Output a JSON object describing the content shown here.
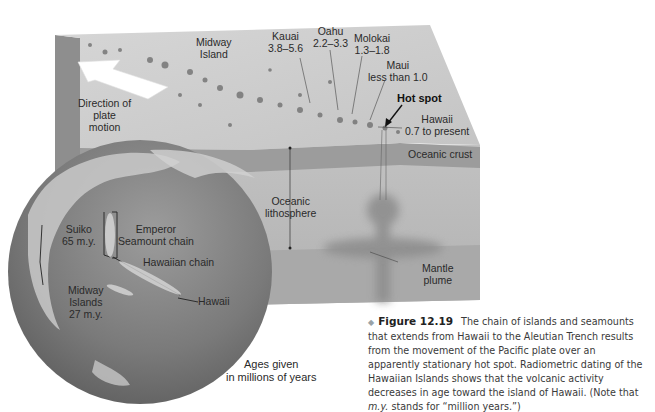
{
  "figure": {
    "number": "Figure 12.19",
    "bullet": "◆",
    "caption_parts": {
      "before_italic": "The chain of islands and seamounts that extends from Hawaii to the Aleutian Trench results from the movement of the Pacific plate over an apparently stationary hot spot. Radiometric dating of the Hawaiian Islands shows that the volcanic activity decreases in age toward the island of Hawaii. (Note that ",
      "italic": "m.y.",
      "after_italic": " stands for “million years.”)"
    }
  },
  "block_labels": {
    "midway": [
      "Midway",
      "Island"
    ],
    "kauai": [
      "Kauai",
      "3.8–5.6"
    ],
    "oahu": [
      "Oahu",
      "2.2–3.3"
    ],
    "molokai": [
      "Molokai",
      "1.3–1.8"
    ],
    "maui": [
      "Maui",
      "less than 1.0"
    ],
    "hot_spot": "Hot spot",
    "hawaii": [
      "Hawaii",
      "0.7 to present"
    ],
    "oceanic_crust": "Oceanic crust",
    "oceanic_lithosphere": [
      "Oceanic",
      "lithosphere"
    ],
    "mantle_plume": [
      "Mantle",
      "plume"
    ],
    "plate_motion": [
      "Direction of",
      "plate",
      "motion"
    ]
  },
  "globe_labels": {
    "suiko": [
      "Suiko",
      "65 m.y."
    ],
    "emperor": [
      "Emperor",
      "Seamount chain"
    ],
    "hawaiian_chain": "Hawaiian chain",
    "midway_islands": [
      "Midway",
      "Islands",
      "27 m.y."
    ],
    "hawaii": "Hawaii"
  },
  "ages_note": [
    "Ages given",
    "in millions of years"
  ],
  "colors": {
    "top_surface": "#cfcfcf",
    "crust": "#9a9a9a",
    "lithosphere": "#bdbdbd",
    "mantle": "#a8a8a8",
    "globe_dark": "#6e6e6e",
    "globe_light": "#b8b8b8",
    "arrow": "#ffffff"
  }
}
